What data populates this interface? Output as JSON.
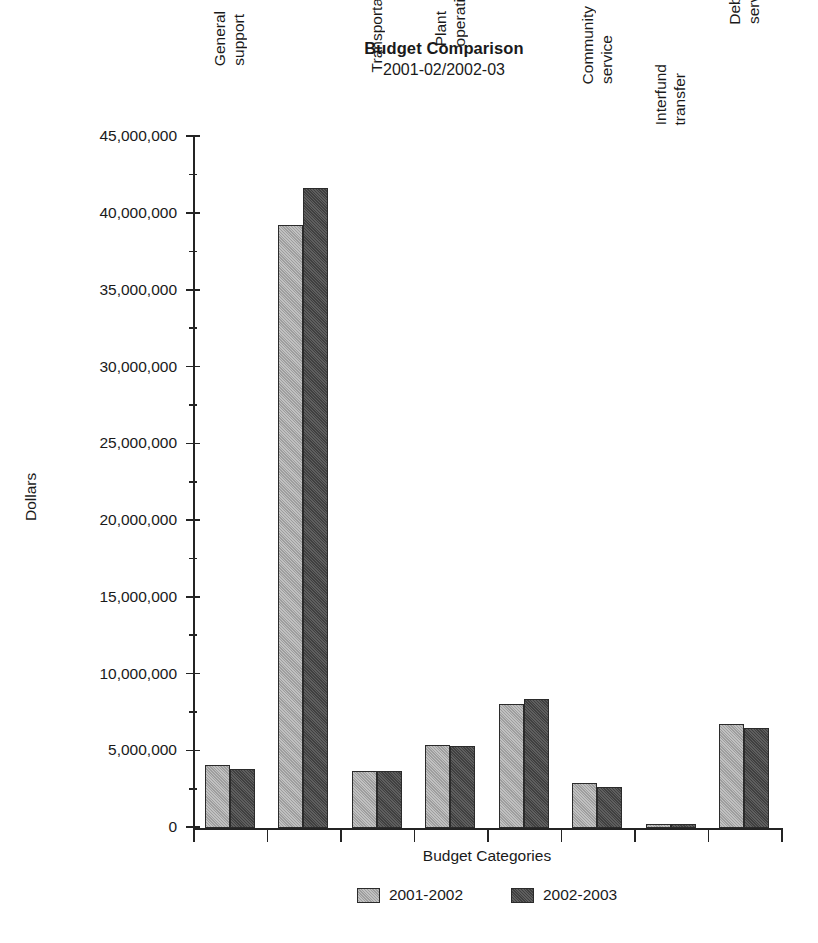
{
  "chart_data": {
    "type": "bar",
    "title": "Budget Comparison",
    "subtitle": "2001-02/2002-03",
    "xlabel": "Budget Categories",
    "ylabel": "Dollars",
    "ylim": [
      0,
      45000000
    ],
    "ytick_step": 5000000,
    "minor_ticks": true,
    "grid": false,
    "legend_position": "bottom",
    "categories": [
      "General support",
      "Instruction",
      "Transportation",
      "Plant operations",
      "Employee benefits",
      "Community service",
      "Interfund transfer",
      "Debt service"
    ],
    "category_label_lines": [
      [
        "General",
        "support"
      ],
      [
        "Instruction"
      ],
      [
        "Transportation"
      ],
      [
        "Plant",
        "operations"
      ],
      [
        "Employee",
        "benefits"
      ],
      [
        "Community",
        "service"
      ],
      [
        "Interfund",
        "transfer"
      ],
      [
        "Debt",
        "service"
      ]
    ],
    "ytick_labels": [
      "0",
      "5,000,000",
      "10,000,000",
      "15,000,000",
      "20,000,000",
      "25,000,000",
      "30,000,000",
      "35,000,000",
      "40,000,000",
      "45,000,000"
    ],
    "ytick_values": [
      0,
      5000000,
      10000000,
      15000000,
      20000000,
      25000000,
      30000000,
      35000000,
      40000000,
      45000000
    ],
    "series": [
      {
        "name": "2001-2002",
        "color": "#a6a6a6",
        "values": [
          4100000,
          39300000,
          3700000,
          5400000,
          8100000,
          2900000,
          250000,
          6800000
        ]
      },
      {
        "name": "2002-2003",
        "color": "#474747",
        "values": [
          3850000,
          41700000,
          3700000,
          5350000,
          8400000,
          2700000,
          250000,
          6500000
        ]
      }
    ]
  }
}
